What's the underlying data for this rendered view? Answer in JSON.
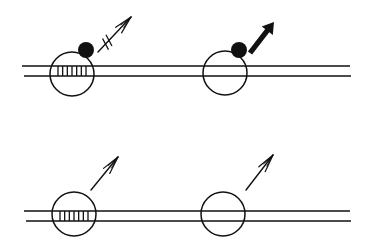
{
  "diagram": {
    "background": "#ffffff",
    "stroke_color": "#111111",
    "panels": [
      {
        "id": "top-left",
        "track": {
          "x1": 22,
          "x2": 350,
          "y_top": 66,
          "y_bottom": 76
        },
        "circle": {
          "cx": 72,
          "cy": 74,
          "r": 22
        },
        "hatch": {
          "present": true,
          "x_start": 58,
          "x_end": 86,
          "count": 7
        },
        "blob": {
          "present": true,
          "cx": 86,
          "cy": 50,
          "r": 8
        },
        "arrow": {
          "style": "open-triple-blocked",
          "x1": 98,
          "y1": 52,
          "x2": 131,
          "y2": 17,
          "blocked": true
        }
      },
      {
        "id": "top-right",
        "track": null,
        "circle": {
          "cx": 225,
          "cy": 73,
          "r": 22
        },
        "hatch": {
          "present": false
        },
        "blob": {
          "present": true,
          "cx": 239,
          "cy": 50,
          "r": 8
        },
        "arrow": {
          "style": "thick-solid",
          "x1": 250,
          "y1": 53,
          "x2": 274,
          "y2": 22,
          "blocked": false
        }
      },
      {
        "id": "bottom-left",
        "track": {
          "x1": 24,
          "x2": 350,
          "y_top": 211,
          "y_bottom": 221
        },
        "circle": {
          "cx": 74,
          "cy": 214,
          "r": 22
        },
        "hatch": {
          "present": true,
          "x_start": 60,
          "x_end": 88,
          "count": 7
        },
        "blob": {
          "present": false
        },
        "arrow": {
          "style": "open-triple",
          "x1": 91,
          "y1": 190,
          "x2": 118,
          "y2": 157,
          "blocked": false
        }
      },
      {
        "id": "bottom-right",
        "track": null,
        "circle": {
          "cx": 223,
          "cy": 214,
          "r": 22
        },
        "hatch": {
          "present": false
        },
        "blob": {
          "present": false
        },
        "arrow": {
          "style": "open-triple",
          "x1": 246,
          "y1": 190,
          "x2": 273,
          "y2": 155,
          "blocked": false
        }
      }
    ]
  }
}
